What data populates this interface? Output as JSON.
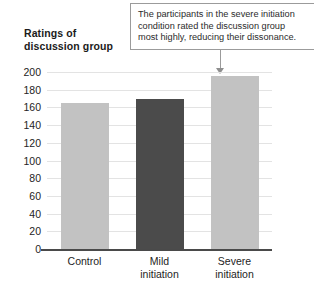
{
  "chart_data": {
    "type": "bar",
    "title": "",
    "xlabel": "",
    "ylabel": "Ratings of discussion group",
    "ylabel_lines": [
      "Ratings of",
      "discussion group"
    ],
    "categories": [
      "Control",
      "Mild initiation",
      "Severe initiation"
    ],
    "category_lines": [
      [
        "Control"
      ],
      [
        "Mild",
        "initiation"
      ],
      [
        "Severe",
        "initiation"
      ]
    ],
    "values": [
      165,
      170,
      195
    ],
    "ylim": [
      0,
      200
    ],
    "ytick_labels": [
      "200",
      "180",
      "160",
      "140",
      "120",
      "100",
      "80",
      "60",
      "40",
      "20",
      "0"
    ],
    "ytick_values": [
      200,
      180,
      160,
      140,
      120,
      100,
      80,
      60,
      40,
      20,
      0
    ],
    "grid": true,
    "legend": "none",
    "bar_colors": [
      "#c2c2c2",
      "#4b4b4b",
      "#c2c2c2"
    ],
    "annotations": [
      {
        "name": "severe-initiation-callout",
        "target_category": "Severe initiation",
        "lines": [
          "The participants in the severe initiation",
          "condition rated the discussion group",
          "most highly, reducing their dissonance."
        ],
        "text": "The participants in the severe initiation condition rated the discussion group most highly, reducing their dissonance."
      }
    ]
  },
  "colors": {
    "bar_light": "#c2c2c2",
    "bar_dark": "#4b4b4b",
    "gridline": "#e3e3e3",
    "axis": "#4a4a4a",
    "callout_border": "#9b9b9b",
    "text": "#242424"
  }
}
